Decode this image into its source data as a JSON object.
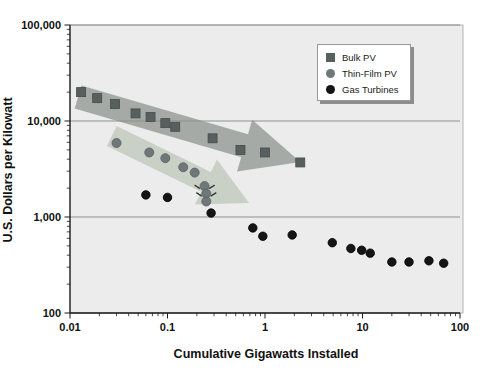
{
  "figure": {
    "width": 485,
    "height": 378,
    "background": "#ffffff",
    "plot_bg": "#ececec",
    "plot_border": "#b5b5b5",
    "grid_color": "#8f8f8f",
    "axis_color": "#1a1a1a"
  },
  "legend": {
    "items": [
      {
        "label": "Bulk PV",
        "marker": "square",
        "color": "#57605f"
      },
      {
        "label": "Thin-Film PV",
        "marker": "circle",
        "color": "#6f7779"
      },
      {
        "label": "Gas Turbines",
        "marker": "circle",
        "color": "#151515"
      }
    ]
  },
  "chart_data": {
    "type": "scatter",
    "title": "",
    "xlabel": "Cumulative Gigawatts Installed",
    "ylabel": "U.S. Dollars per Kilowatt",
    "x_scale": "log",
    "y_scale": "log",
    "xlim": [
      0.01,
      100
    ],
    "ylim": [
      100,
      100000
    ],
    "grid": "horizontal-major",
    "legend_position": "upper-right-inside",
    "x_ticks": [
      {
        "value": 0.01,
        "label": "0.01"
      },
      {
        "value": 0.1,
        "label": "0.1"
      },
      {
        "value": 1,
        "label": "1"
      },
      {
        "value": 10,
        "label": "10"
      },
      {
        "value": 100,
        "label": "100"
      }
    ],
    "y_ticks": [
      {
        "value": 100000,
        "label": "100,000"
      },
      {
        "value": 10000,
        "label": "10,000"
      },
      {
        "value": 1000,
        "label": "1,000"
      },
      {
        "value": 100,
        "label": "100"
      }
    ],
    "series": [
      {
        "name": "Bulk PV",
        "marker": "square",
        "size": 9,
        "color": "#57605f",
        "stroke": "#454d4c",
        "points": [
          [
            0.013,
            20000
          ],
          [
            0.019,
            17300
          ],
          [
            0.029,
            15000
          ],
          [
            0.047,
            12000
          ],
          [
            0.067,
            11000
          ],
          [
            0.095,
            9500
          ],
          [
            0.12,
            8700
          ],
          [
            0.29,
            6600
          ],
          [
            0.56,
            5000
          ],
          [
            1.0,
            4700
          ],
          [
            2.3,
            3700
          ]
        ]
      },
      {
        "name": "Thin-Film PV",
        "marker": "circle",
        "size": 9,
        "color": "#6f7779",
        "stroke": "#586062",
        "points": [
          [
            0.03,
            5900
          ],
          [
            0.065,
            4700
          ],
          [
            0.095,
            4100
          ],
          [
            0.145,
            3300
          ],
          [
            0.19,
            2900
          ],
          [
            0.24,
            2100
          ],
          [
            0.25,
            1750
          ],
          [
            0.25,
            1450
          ]
        ]
      },
      {
        "name": "Gas Turbines",
        "marker": "circle",
        "size": 8.5,
        "color": "#151515",
        "stroke": "#000000",
        "points": [
          [
            0.06,
            1700
          ],
          [
            0.1,
            1600
          ],
          [
            0.28,
            1100
          ],
          [
            0.75,
            770
          ],
          [
            0.95,
            630
          ],
          [
            1.9,
            650
          ],
          [
            4.9,
            540
          ],
          [
            7.6,
            470
          ],
          [
            9.8,
            450
          ],
          [
            12,
            420
          ],
          [
            20,
            340
          ],
          [
            30,
            340
          ],
          [
            48,
            350
          ],
          [
            68,
            330
          ]
        ]
      }
    ],
    "annotations": {
      "trend_arrows": [
        {
          "name": "bulk-pv-trend-arrow",
          "color": "#a2a7a2",
          "tail": [
            0.0121,
            17800
          ],
          "tip": [
            2.3,
            3740
          ],
          "shaft_half_px": 12,
          "head_half_px": 27,
          "head_len_px": 58
        },
        {
          "name": "thin-film-trend-arrow",
          "color": "#c7cfc3",
          "tail": [
            0.0268,
            6980
          ],
          "tip": [
            0.687,
            1400
          ],
          "shaft_half_px": 11,
          "head_half_px": 25,
          "head_len_px": 48
        }
      ],
      "flick_marks": [
        {
          "x": 0.24,
          "y": 2100
        },
        {
          "x": 0.25,
          "y": 1750
        }
      ]
    }
  }
}
